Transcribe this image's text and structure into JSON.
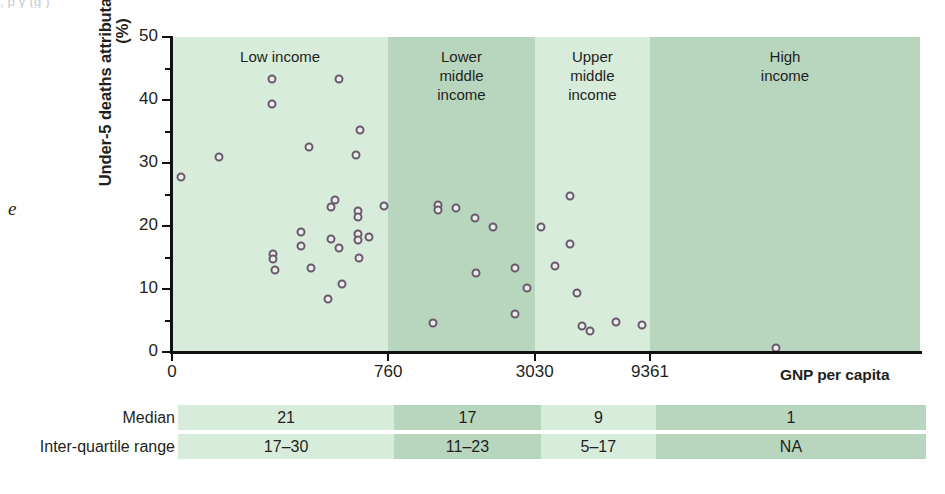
{
  "figure": {
    "top_clipped_caption": ", p                                    y                                    (g           )",
    "margin_fragment": "e"
  },
  "chart_data": {
    "type": "scatter",
    "title": "",
    "xlabel": "GNP per capita",
    "ylabel": "Under-5 deaths attributable to diarrhoea (%)",
    "ylim": [
      0,
      50
    ],
    "yticks": [
      0,
      10,
      20,
      30,
      40,
      50
    ],
    "ytick_labels": [
      "0",
      "10",
      "20",
      "30",
      "40",
      "50"
    ],
    "xticks": [
      0,
      760,
      3030,
      9361
    ],
    "xtick_labels": [
      "0",
      "760",
      "3030",
      "9361"
    ],
    "grid": false,
    "legend": "none",
    "bands": [
      {
        "label": "Low income",
        "color": "#d7ecdb",
        "x_start_pct": 0.0,
        "x_end_pct": 28.9
      },
      {
        "label": "Lower\nmiddle\nincome",
        "color": "#b8d6be",
        "x_start_pct": 28.9,
        "x_end_pct": 48.5
      },
      {
        "label": "Upper\nmiddle\nincome",
        "color": "#d7ecdb",
        "x_start_pct": 48.5,
        "x_end_pct": 63.9
      },
      {
        "label": "High\nincome",
        "color": "#b8d6be",
        "x_start_pct": 63.9,
        "x_end_pct": 100.0
      }
    ],
    "marker": {
      "shape": "circle-open",
      "edge_color": "#6b5a6e",
      "fill": "#e9eee9",
      "size": 9
    },
    "points": [
      {
        "xp": 1.2,
        "y": 27.8
      },
      {
        "xp": 6.3,
        "y": 31.0
      },
      {
        "xp": 13.4,
        "y": 43.4
      },
      {
        "xp": 13.4,
        "y": 39.3
      },
      {
        "xp": 13.5,
        "y": 15.6
      },
      {
        "xp": 13.5,
        "y": 14.7
      },
      {
        "xp": 13.8,
        "y": 13.0
      },
      {
        "xp": 18.3,
        "y": 32.6
      },
      {
        "xp": 17.2,
        "y": 19.1
      },
      {
        "xp": 17.3,
        "y": 16.8
      },
      {
        "xp": 18.6,
        "y": 13.3
      },
      {
        "xp": 22.3,
        "y": 43.4
      },
      {
        "xp": 21.3,
        "y": 23.0
      },
      {
        "xp": 21.8,
        "y": 24.2
      },
      {
        "xp": 21.3,
        "y": 17.9
      },
      {
        "xp": 22.3,
        "y": 16.5
      },
      {
        "xp": 22.7,
        "y": 10.8
      },
      {
        "xp": 20.8,
        "y": 8.4
      },
      {
        "xp": 25.1,
        "y": 35.2
      },
      {
        "xp": 24.6,
        "y": 31.2
      },
      {
        "xp": 24.9,
        "y": 22.4
      },
      {
        "xp": 24.9,
        "y": 21.4
      },
      {
        "xp": 24.8,
        "y": 18.7
      },
      {
        "xp": 24.9,
        "y": 17.7
      },
      {
        "xp": 25.0,
        "y": 14.9
      },
      {
        "xp": 26.4,
        "y": 18.3
      },
      {
        "xp": 28.3,
        "y": 23.1
      },
      {
        "xp": 34.9,
        "y": 4.6
      },
      {
        "xp": 35.6,
        "y": 23.3
      },
      {
        "xp": 35.6,
        "y": 22.6
      },
      {
        "xp": 38.0,
        "y": 22.9
      },
      {
        "xp": 40.5,
        "y": 21.2
      },
      {
        "xp": 42.9,
        "y": 19.9
      },
      {
        "xp": 40.7,
        "y": 12.5
      },
      {
        "xp": 45.9,
        "y": 13.4
      },
      {
        "xp": 47.4,
        "y": 10.1
      },
      {
        "xp": 45.8,
        "y": 6.0
      },
      {
        "xp": 49.3,
        "y": 19.9
      },
      {
        "xp": 53.2,
        "y": 24.7
      },
      {
        "xp": 53.2,
        "y": 17.2
      },
      {
        "xp": 51.2,
        "y": 13.7
      },
      {
        "xp": 54.1,
        "y": 9.3
      },
      {
        "xp": 54.8,
        "y": 4.2
      },
      {
        "xp": 55.9,
        "y": 3.3
      },
      {
        "xp": 59.3,
        "y": 4.8
      },
      {
        "xp": 62.8,
        "y": 4.3
      },
      {
        "xp": 80.7,
        "y": 0.7
      }
    ]
  },
  "summary_table": {
    "rows": [
      {
        "label": "Median",
        "values": [
          "21",
          "17",
          "9",
          "1"
        ]
      },
      {
        "label": "Inter-quartile range",
        "values": [
          "17–30",
          "11–23",
          "5–17",
          "NA"
        ]
      }
    ],
    "column_colors": [
      "#d7ecdb",
      "#b8d6be",
      "#d7ecdb",
      "#b8d6be"
    ]
  }
}
